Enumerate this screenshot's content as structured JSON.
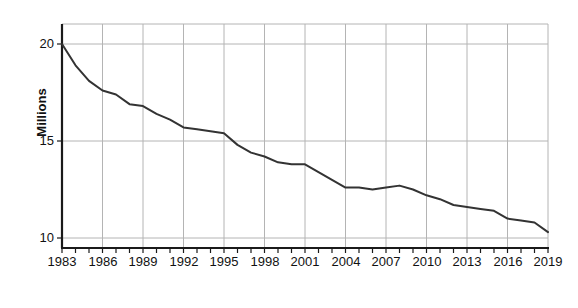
{
  "chart_data": {
    "type": "line",
    "title": "",
    "subtitle": "",
    "xlabel": "Year",
    "ylabel": "Millions",
    "xlim": [
      1983,
      2019
    ],
    "ylim": [
      9.3,
      20.9
    ],
    "grid": true,
    "legend": false,
    "legend_position": "none",
    "line_color": "#333333",
    "grid_color": "#b4b4b4",
    "axis_color": "#1a1a1a",
    "x_tick_interval_years": 1,
    "x_label_interval_years": 3,
    "y_ticks": [
      10,
      15,
      20
    ],
    "y_tick_labels": [
      "10",
      "15",
      "20"
    ],
    "x_ticks": [
      1983,
      1984,
      1985,
      1986,
      1987,
      1988,
      1989,
      1990,
      1991,
      1992,
      1993,
      1994,
      1995,
      1996,
      1997,
      1998,
      1999,
      2000,
      2001,
      2002,
      2003,
      2004,
      2005,
      2006,
      2007,
      2008,
      2009,
      2010,
      2011,
      2012,
      2013,
      2014,
      2015,
      2016,
      2017,
      2018,
      2019
    ],
    "x_tick_labels": [
      "1983",
      "1986",
      "1989",
      "1992",
      "1995",
      "1998",
      "2001",
      "2004",
      "2007",
      "2010",
      "2013",
      "2016",
      "2019"
    ],
    "x_gridlines": [
      1983,
      1986,
      1989,
      1992,
      1995,
      1998,
      2001,
      2004,
      2007,
      2010,
      2013,
      2016,
      2019
    ],
    "x": [
      1983,
      1984,
      1985,
      1986,
      1987,
      1988,
      1989,
      1990,
      1991,
      1992,
      1993,
      1994,
      1995,
      1996,
      1997,
      1998,
      1999,
      2000,
      2001,
      2002,
      2003,
      2004,
      2005,
      2006,
      2007,
      2008,
      2009,
      2010,
      2011,
      2012,
      2013,
      2014,
      2015,
      2016,
      2017,
      2018,
      2019
    ],
    "values": [
      20.0,
      18.9,
      18.1,
      17.6,
      17.4,
      16.9,
      16.8,
      16.4,
      16.1,
      15.7,
      15.6,
      15.5,
      15.4,
      14.8,
      14.4,
      14.2,
      13.9,
      13.8,
      13.8,
      13.4,
      13.0,
      12.6,
      12.6,
      12.5,
      12.6,
      12.7,
      12.5,
      12.2,
      12.0,
      11.7,
      11.6,
      11.5,
      11.4,
      11.0,
      10.9,
      10.8,
      10.3
    ],
    "series": [
      {
        "name": "Millions",
        "values": [
          20.0,
          18.9,
          18.1,
          17.6,
          17.4,
          16.9,
          16.8,
          16.4,
          16.1,
          15.7,
          15.6,
          15.5,
          15.4,
          14.8,
          14.4,
          14.2,
          13.9,
          13.8,
          13.8,
          13.4,
          13.0,
          12.6,
          12.6,
          12.5,
          12.6,
          12.7,
          12.5,
          12.2,
          12.0,
          11.7,
          11.6,
          11.5,
          11.4,
          11.0,
          10.9,
          10.8,
          10.3
        ]
      }
    ]
  },
  "axes": {
    "y_title": "Millions",
    "x_title": "Year"
  },
  "y_labels": [
    {
      "text": "20"
    },
    {
      "text": "15"
    },
    {
      "text": "10"
    }
  ],
  "x_labels": [
    {
      "text": "1983"
    },
    {
      "text": "1986"
    },
    {
      "text": "1989"
    },
    {
      "text": "1992"
    },
    {
      "text": "1995"
    },
    {
      "text": "1998"
    },
    {
      "text": "2001"
    },
    {
      "text": "2004"
    },
    {
      "text": "2007"
    },
    {
      "text": "2010"
    },
    {
      "text": "2013"
    },
    {
      "text": "2016"
    },
    {
      "text": "2019"
    }
  ]
}
